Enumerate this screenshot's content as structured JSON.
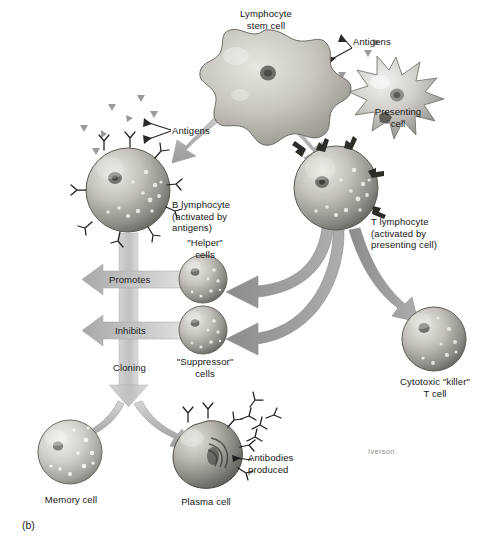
{
  "figure": {
    "panel_label": "(b)",
    "credit": "Iverson",
    "title_implied": "Lymphocyte activation and clonal selection"
  },
  "cells": [
    {
      "id": "stem",
      "label": "Lymphocyte\nstem cell",
      "shape": "amoeboid-blob",
      "x": 265,
      "y": 75,
      "r": 47
    },
    {
      "id": "presenting",
      "label": "Presenting\ncell",
      "shape": "spiky-dendritic",
      "x": 396,
      "y": 97,
      "r": 42
    },
    {
      "id": "b_lymphocyte",
      "label": "B lymphocyte\n(activated by\nantigens)",
      "shape": "sphere-with-antibodies",
      "x": 128,
      "y": 190,
      "r": 42
    },
    {
      "id": "t_lymphocyte",
      "label": "T lymphocyte\n(activated by\npresenting cell)",
      "shape": "sphere-with-receptors",
      "x": 336,
      "y": 188,
      "r": 42
    },
    {
      "id": "helper",
      "label": "\"Helper\"\ncells",
      "shape": "small-sphere",
      "x": 203,
      "y": 279,
      "r": 24
    },
    {
      "id": "suppressor",
      "label": "\"Suppressor\"\ncells",
      "shape": "small-sphere",
      "x": 203,
      "y": 330,
      "r": 24
    },
    {
      "id": "cytotoxic",
      "label": "Cytotoxic \"killer\"\nT cell",
      "shape": "sphere",
      "x": 434,
      "y": 339,
      "r": 32
    },
    {
      "id": "memory",
      "label": "Memory cell",
      "shape": "sphere",
      "x": 70,
      "y": 452,
      "r": 32
    },
    {
      "id": "plasma",
      "label": "Plasma cell",
      "shape": "sphere-secreting",
      "x": 207,
      "y": 455,
      "r": 34
    }
  ],
  "annotations": {
    "antigens_left": "Antigens",
    "antigens_right": "Antigens",
    "antibodies": "Antibodies\nproduced"
  },
  "flow_labels": {
    "promotes": "Promotes",
    "inhibits": "Inhibits",
    "cloning": "Cloning"
  },
  "colors": {
    "arrow_light": "#c9c9c9",
    "arrow_mid": "#a8a8a8",
    "arrow_dark": "#8f8f8f",
    "cell_light": "#d8d6d0",
    "cell_mid": "#9e9c96",
    "cell_dark": "#6b6964",
    "outline": "#4a4845",
    "text": "#161616",
    "credit": "#8e8e8e",
    "background": "#ffffff"
  }
}
